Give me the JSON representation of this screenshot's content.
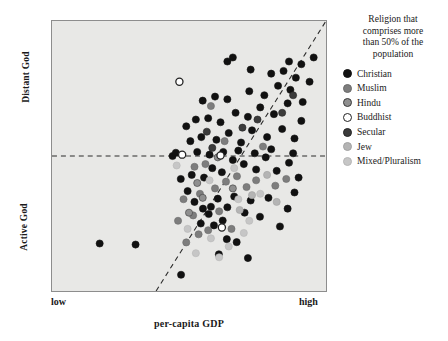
{
  "chart_data": {
    "type": "scatter",
    "title": "",
    "xlabel": "per-capita GDP",
    "ylabel": "",
    "xtick_labels": [
      "low",
      "high"
    ],
    "ytick_labels": [
      "Active God",
      "Distant God"
    ],
    "y_axis_low_label": "Active God",
    "y_axis_high_label": "Distant God",
    "grid": false,
    "legend_position": "right",
    "xlim": [
      0,
      100
    ],
    "ylim": [
      0,
      100
    ],
    "annotations": [
      {
        "name": "horizontal-reference-line",
        "type": "hline",
        "y": 50,
        "style": "dashed"
      },
      {
        "name": "diagonal-trend-line",
        "type": "line",
        "x": [
          38,
          100
        ],
        "y": [
          0,
          100
        ],
        "style": "dashed"
      }
    ],
    "legend": {
      "title": "Religion that comprises more than 50% of the population",
      "title_lines": [
        "Religion that",
        "comprises more",
        "than 50% of the",
        "population"
      ],
      "entries": [
        {
          "label": "Christian",
          "color": "#111111",
          "edge": "#111111"
        },
        {
          "label": "Muslim",
          "color": "#7d7d7d",
          "edge": "#6a6a6a"
        },
        {
          "label": "Hindu",
          "color": "#8f8f8f",
          "edge": "#3a3a3a"
        },
        {
          "label": "Buddhist",
          "color": "#ffffff",
          "edge": "#222222"
        },
        {
          "label": "Secular",
          "color": "#3b3b3b",
          "edge": "#242424"
        },
        {
          "label": "Jew",
          "color": "#b4b4b4",
          "edge": "#a2a2a2"
        },
        {
          "label": "Mixed/Pluralism",
          "color": "#c6c6c6",
          "edge": "#b6b6b6"
        }
      ]
    },
    "series": [
      {
        "name": "Christian",
        "color": "#111111",
        "points": [
          [
            17.4,
            17.6
          ],
          [
            47.1,
            6.0
          ],
          [
            30.5,
            17.2
          ],
          [
            60.9,
            13.6
          ],
          [
            71.5,
            12.2
          ],
          [
            63.8,
            19.2
          ],
          [
            67.4,
            18.1
          ],
          [
            54.3,
            25.0
          ],
          [
            59.1,
            24.3
          ],
          [
            62.3,
            26.1
          ],
          [
            57.2,
            28.5
          ],
          [
            55.1,
            30.5
          ],
          [
            58.0,
            31.2
          ],
          [
            52.0,
            33.0
          ],
          [
            60.5,
            34.2
          ],
          [
            64.0,
            31.0
          ],
          [
            66.5,
            35.0
          ],
          [
            70.3,
            29.0
          ],
          [
            72.5,
            33.5
          ],
          [
            75.9,
            27.5
          ],
          [
            79.0,
            34.5
          ],
          [
            83.2,
            23.9
          ],
          [
            86.0,
            30.5
          ],
          [
            88.5,
            36.5
          ],
          [
            49.5,
            37.0
          ],
          [
            47.0,
            41.5
          ],
          [
            51.0,
            43.0
          ],
          [
            55.5,
            42.0
          ],
          [
            58.5,
            45.5
          ],
          [
            62.0,
            44.0
          ],
          [
            66.0,
            48.5
          ],
          [
            70.0,
            47.0
          ],
          [
            74.5,
            45.0
          ],
          [
            78.0,
            49.5
          ],
          [
            82.0,
            44.5
          ],
          [
            86.5,
            47.5
          ],
          [
            90.0,
            42.0
          ],
          [
            44.0,
            50.0
          ],
          [
            45.2,
            51.2
          ],
          [
            53.0,
            51.5
          ],
          [
            57.5,
            50.5
          ],
          [
            62.5,
            51.5
          ],
          [
            68.0,
            52.0
          ],
          [
            74.0,
            51.0
          ],
          [
            80.0,
            52.5
          ],
          [
            88.0,
            51.0
          ],
          [
            50.5,
            55.5
          ],
          [
            54.5,
            57.0
          ],
          [
            60.0,
            56.0
          ],
          [
            64.5,
            58.5
          ],
          [
            69.0,
            55.0
          ],
          [
            73.0,
            59.5
          ],
          [
            78.5,
            57.0
          ],
          [
            84.0,
            60.0
          ],
          [
            88.5,
            56.5
          ],
          [
            49.0,
            61.0
          ],
          [
            52.5,
            63.5
          ],
          [
            57.0,
            64.0
          ],
          [
            61.5,
            62.5
          ],
          [
            67.0,
            66.0
          ],
          [
            71.5,
            64.5
          ],
          [
            76.0,
            68.0
          ],
          [
            81.0,
            65.5
          ],
          [
            86.0,
            69.5
          ],
          [
            91.0,
            63.0
          ],
          [
            55.0,
            70.5
          ],
          [
            59.5,
            72.0
          ],
          [
            64.0,
            71.0
          ],
          [
            72.0,
            74.0
          ],
          [
            77.5,
            72.5
          ],
          [
            82.5,
            76.0
          ],
          [
            87.0,
            74.5
          ],
          [
            91.5,
            70.0
          ],
          [
            80.0,
            80.5
          ],
          [
            84.5,
            81.5
          ],
          [
            89.0,
            79.0
          ],
          [
            86.5,
            85.0
          ],
          [
            91.0,
            84.0
          ],
          [
            94.0,
            77.5
          ],
          [
            95.5,
            86.5
          ],
          [
            64.0,
            85.0
          ],
          [
            66.0,
            86.5
          ],
          [
            72.5,
            82.0
          ]
        ]
      },
      {
        "name": "Muslim",
        "color": "#7d7d7d",
        "points": [
          [
            49.0,
            18.0
          ],
          [
            53.5,
            21.0
          ],
          [
            46.0,
            26.0
          ],
          [
            51.5,
            28.0
          ],
          [
            57.0,
            22.5
          ],
          [
            61.0,
            29.5
          ],
          [
            65.5,
            23.0
          ],
          [
            54.0,
            36.0
          ],
          [
            48.0,
            34.0
          ],
          [
            59.5,
            38.0
          ],
          [
            63.5,
            40.5
          ],
          [
            56.0,
            47.0
          ],
          [
            67.5,
            42.5
          ],
          [
            71.0,
            38.5
          ],
          [
            74.5,
            41.0
          ],
          [
            52.0,
            46.0
          ],
          [
            63.0,
            55.5
          ],
          [
            58.0,
            68.5
          ],
          [
            77.0,
            53.5
          ],
          [
            81.5,
            39.0
          ],
          [
            85.5,
            41.5
          ]
        ]
      },
      {
        "name": "Hindu",
        "color": "#8f8f8f",
        "points": [
          [
            55.0,
            34.5
          ],
          [
            53.0,
            40.0
          ],
          [
            60.5,
            49.5
          ],
          [
            66.0,
            38.0
          ],
          [
            50.0,
            29.0
          ]
        ]
      },
      {
        "name": "Buddhist",
        "color": "#ffffff",
        "points": [
          [
            47.5,
            50.5
          ],
          [
            61.5,
            50.2
          ],
          [
            46.5,
            77.5
          ],
          [
            62.0,
            23.5
          ]
        ]
      },
      {
        "name": "Secular",
        "color": "#3b3b3b",
        "points": [
          [
            56.5,
            59.0
          ],
          [
            69.5,
            60.5
          ],
          [
            84.0,
            66.0
          ],
          [
            88.0,
            72.5
          ],
          [
            75.0,
            63.5
          ],
          [
            58.5,
            53.0
          ]
        ]
      },
      {
        "name": "Jew",
        "color": "#b4b4b4",
        "points": [
          [
            73.0,
            35.5
          ],
          [
            78.5,
            43.0
          ],
          [
            68.5,
            30.0
          ],
          [
            82.0,
            33.0
          ]
        ]
      },
      {
        "name": "Mixed/Pluralism",
        "color": "#c6c6c6",
        "points": [
          [
            58.0,
            19.5
          ],
          [
            64.5,
            16.5
          ],
          [
            52.5,
            14.0
          ],
          [
            70.0,
            21.5
          ],
          [
            61.0,
            12.5
          ],
          [
            66.5,
            45.5
          ],
          [
            72.0,
            26.0
          ],
          [
            57.5,
            41.0
          ],
          [
            49.5,
            23.0
          ],
          [
            68.0,
            34.0
          ],
          [
            45.5,
            46.5
          ],
          [
            76.0,
            36.0
          ]
        ]
      }
    ]
  }
}
